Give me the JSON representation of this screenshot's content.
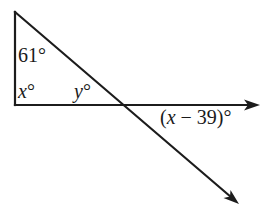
{
  "diagram": {
    "type": "geometry-angle-problem",
    "points": {
      "top_vertex": [
        15,
        12
      ],
      "right_angle_vertex": [
        15,
        105
      ],
      "intersection": [
        124,
        105
      ],
      "horizontal_ray_tip": [
        259,
        105
      ],
      "diagonal_ray_tip": [
        238,
        203
      ]
    },
    "angles": {
      "top": {
        "value": "61",
        "unit": "°"
      },
      "bottom_left": {
        "variable": "x",
        "unit": "°"
      },
      "interior_at_intersection": {
        "variable": "y",
        "unit": "°"
      },
      "exterior": {
        "prefix": "(",
        "variable": "x",
        "operator": " − ",
        "constant": "39",
        "suffix": ")",
        "unit": "°"
      }
    },
    "colors": {
      "stroke": "#1c1c1c",
      "text": "#1a1a1a",
      "background": "#ffffff"
    }
  }
}
